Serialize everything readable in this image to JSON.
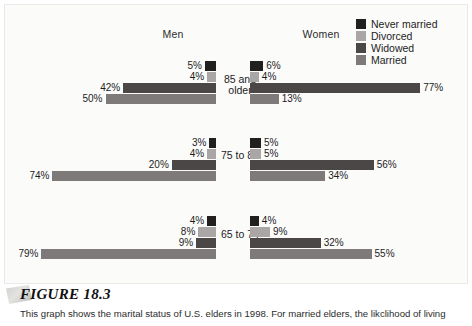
{
  "figure": {
    "title": "FIGURE 18.3",
    "caption": "This graph shows the marital status of U.S. elders in 1998. For married elders, the likclihood of living"
  },
  "headers": {
    "men": "Men",
    "women": "Women"
  },
  "legend": {
    "items": [
      {
        "label": "Never married",
        "color": "#221f1f"
      },
      {
        "label": "Divorced",
        "color": "#a9a6a5"
      },
      {
        "label": "Widowed",
        "color": "#4a4746"
      },
      {
        "label": "Married",
        "color": "#7d7a79"
      }
    ]
  },
  "chart_data": {
    "type": "bar",
    "orientation": "horizontal-bidirectional",
    "title": "Marital status of U.S. elders in 1998",
    "xlabel": "",
    "ylabel": "Age group",
    "xlim": [
      0,
      80
    ],
    "grid": false,
    "legend_position": "top-right",
    "value_suffix": "%",
    "categories": [
      "85 and older",
      "75 to 84",
      "65 to 74"
    ],
    "category_labels": [
      [
        "85 and",
        "older"
      ],
      [
        "75 to 84"
      ],
      [
        "65 to 74"
      ]
    ],
    "series_names": [
      "Never married",
      "Divorced",
      "Widowed",
      "Married"
    ],
    "panels": [
      {
        "name": "Men",
        "groups": [
          {
            "category": "85 and older",
            "bars": [
              {
                "series": "Never married",
                "value": 5,
                "label": "5%"
              },
              {
                "series": "Divorced",
                "value": 4,
                "label": "4%"
              },
              {
                "series": "Widowed",
                "value": 42,
                "label": "42%"
              },
              {
                "series": "Married",
                "value": 50,
                "label": "50%"
              }
            ]
          },
          {
            "category": "75 to 84",
            "bars": [
              {
                "series": "Never married",
                "value": 3,
                "label": "3%"
              },
              {
                "series": "Divorced",
                "value": 4,
                "label": "4%"
              },
              {
                "series": "Widowed",
                "value": 20,
                "label": "20%"
              },
              {
                "series": "Married",
                "value": 74,
                "label": "74%"
              }
            ]
          },
          {
            "category": "65 to 74",
            "bars": [
              {
                "series": "Never married",
                "value": 4,
                "label": "4%"
              },
              {
                "series": "Divorced",
                "value": 8,
                "label": "8%"
              },
              {
                "series": "Widowed",
                "value": 9,
                "label": "9%"
              },
              {
                "series": "Married",
                "value": 79,
                "label": "79%"
              }
            ]
          }
        ]
      },
      {
        "name": "Women",
        "groups": [
          {
            "category": "85 and older",
            "bars": [
              {
                "series": "Never married",
                "value": 6,
                "label": "6%"
              },
              {
                "series": "Divorced",
                "value": 4,
                "label": "4%"
              },
              {
                "series": "Widowed",
                "value": 77,
                "label": "77%"
              },
              {
                "series": "Married",
                "value": 13,
                "label": "13%"
              }
            ]
          },
          {
            "category": "75 to 84",
            "bars": [
              {
                "series": "Never married",
                "value": 5,
                "label": "5%"
              },
              {
                "series": "Divorced",
                "value": 5,
                "label": "5%"
              },
              {
                "series": "Widowed",
                "value": 56,
                "label": "56%"
              },
              {
                "series": "Married",
                "value": 34,
                "label": "34%"
              }
            ]
          },
          {
            "category": "65 to 74",
            "bars": [
              {
                "series": "Never married",
                "value": 4,
                "label": "4%"
              },
              {
                "series": "Divorced",
                "value": 9,
                "label": "9%"
              },
              {
                "series": "Widowed",
                "value": 32,
                "label": "32%"
              },
              {
                "series": "Married",
                "value": 55,
                "label": "55%"
              }
            ]
          }
        ]
      }
    ]
  },
  "layout": {
    "center_left": 211,
    "center_right": 245,
    "px_per_percent": 2.21,
    "bar_height": 10,
    "bar_gap": 1,
    "group_tops": [
      56,
      133,
      211
    ],
    "age_label_tops": [
      69,
      145,
      224
    ]
  }
}
